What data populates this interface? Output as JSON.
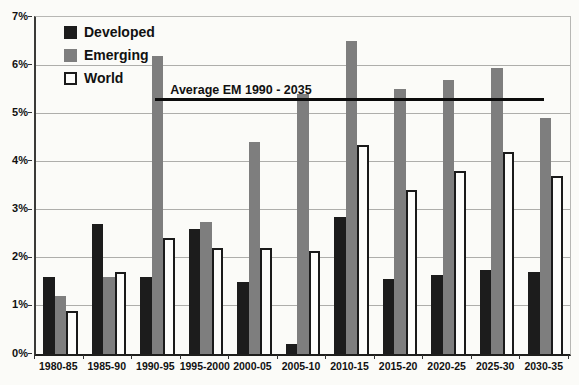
{
  "chart_data": {
    "type": "bar",
    "title": "",
    "xlabel": "",
    "ylabel": "",
    "categories": [
      "1980-85",
      "1985-90",
      "1990-95",
      "1995-2000",
      "2000-05",
      "2005-10",
      "2010-15",
      "2015-20",
      "2020-25",
      "2025-30",
      "2030-35"
    ],
    "series": [
      {
        "name": "Developed",
        "color": "#1c1c1c",
        "values": [
          1.6,
          2.7,
          1.6,
          2.6,
          1.5,
          0.2,
          2.85,
          1.55,
          1.65,
          1.75,
          1.7
        ]
      },
      {
        "name": "Emerging",
        "color": "#7e7e7e",
        "values": [
          1.2,
          1.6,
          6.2,
          2.75,
          4.4,
          5.4,
          6.5,
          5.5,
          5.7,
          5.95,
          4.9
        ]
      },
      {
        "name": "World",
        "color": "#fdfdfb",
        "border_color": "#1a1a1a",
        "values": [
          0.9,
          1.7,
          2.4,
          2.2,
          2.2,
          2.15,
          4.35,
          3.4,
          3.8,
          4.2,
          3.7
        ]
      }
    ],
    "ylim": [
      0,
      7
    ],
    "yticks": [
      "0%",
      "1%",
      "2%",
      "3%",
      "4%",
      "5%",
      "6%",
      "7%"
    ],
    "grid": true,
    "legend_position": "top-left",
    "annotation": {
      "label": "Average EM 1990 - 2035",
      "value": 5.26,
      "span_category_start": 2,
      "span_category_end": 10
    }
  }
}
